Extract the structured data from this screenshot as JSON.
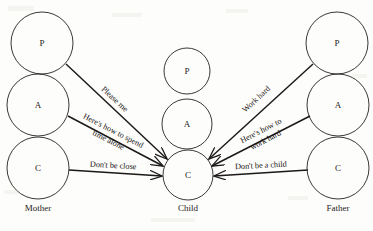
{
  "figure": {
    "type": "diagram",
    "subtype": "transactional-analysis-ego-state-diagram",
    "background_color": "#fdfdfc",
    "ink_color": "#1b1816"
  },
  "columns": [
    {
      "key": "mother",
      "label": "Mother",
      "label_x": 38,
      "label_y": 211,
      "circle_radius": 31,
      "states": [
        {
          "key": "mother-parent",
          "letter": "P",
          "cx": 42,
          "cy": 43,
          "r": 31
        },
        {
          "key": "mother-adult",
          "letter": "A",
          "cx": 38,
          "cy": 105,
          "r": 31
        },
        {
          "key": "mother-child",
          "letter": "C",
          "cx": 38,
          "cy": 168,
          "r": 31
        }
      ]
    },
    {
      "key": "child",
      "label": "Child",
      "label_x": 188,
      "label_y": 211,
      "circle_radius": 24,
      "states": [
        {
          "key": "child-parent",
          "letter": "P",
          "cx": 187,
          "cy": 71,
          "r": 23
        },
        {
          "key": "child-adult",
          "letter": "A",
          "cx": 187,
          "cy": 124,
          "r": 25
        },
        {
          "key": "child-child",
          "letter": "C",
          "cx": 188,
          "cy": 175,
          "r": 25
        }
      ]
    },
    {
      "key": "father",
      "label": "Father",
      "label_x": 338,
      "label_y": 211,
      "circle_radius": 31,
      "states": [
        {
          "key": "father-parent",
          "letter": "P",
          "cx": 337,
          "cy": 43,
          "r": 31
        },
        {
          "key": "father-adult",
          "letter": "A",
          "cx": 338,
          "cy": 105,
          "r": 31
        },
        {
          "key": "father-child",
          "letter": "C",
          "cx": 338,
          "cy": 168,
          "r": 31
        }
      ]
    }
  ],
  "messages": [
    {
      "key": "please-me",
      "text": "Please me",
      "from": "mother-parent",
      "to": "child-child",
      "x1": 66,
      "y1": 64,
      "x2": 167,
      "y2": 159,
      "label_x": 113,
      "label_y": 101,
      "rotation": 43,
      "lines": [
        "Please me"
      ]
    },
    {
      "key": "heres-how-to-spend-time-alone",
      "text": "Here's how to spend time alone",
      "from": "mother-adult",
      "to": "child-child",
      "x1": 68,
      "y1": 116,
      "x2": 163,
      "y2": 166,
      "label_x": 112,
      "label_y": 133,
      "rotation": 27,
      "lines": [
        "Here's how to spend",
        "time alone"
      ]
    },
    {
      "key": "dont-be-close",
      "text": "Don't be close",
      "from": "mother-child",
      "to": "child-child",
      "x1": 69,
      "y1": 170,
      "x2": 162,
      "y2": 176,
      "label_x": 113,
      "label_y": 168,
      "rotation": 3,
      "lines": [
        "Don't be close"
      ]
    },
    {
      "key": "work-hard",
      "text": "Work hard",
      "from": "father-parent",
      "to": "child-child",
      "x1": 313,
      "y1": 64,
      "x2": 209,
      "y2": 159,
      "label_x": 258,
      "label_y": 101,
      "rotation": -43,
      "lines": [
        "Work hard"
      ]
    },
    {
      "key": "heres-how-to-work-hard",
      "text": "Here's how to work hard",
      "from": "father-adult",
      "to": "child-child",
      "x1": 310,
      "y1": 116,
      "x2": 212,
      "y2": 166,
      "label_x": 262,
      "label_y": 133,
      "rotation": -27,
      "lines": [
        "Here's how to",
        "work hard"
      ]
    },
    {
      "key": "dont-be-a-child",
      "text": "Don't be a child",
      "from": "father-child",
      "to": "child-child",
      "x1": 308,
      "y1": 170,
      "x2": 214,
      "y2": 176,
      "label_x": 261,
      "label_y": 168,
      "rotation": -3,
      "lines": [
        "Don't be a child"
      ]
    }
  ]
}
